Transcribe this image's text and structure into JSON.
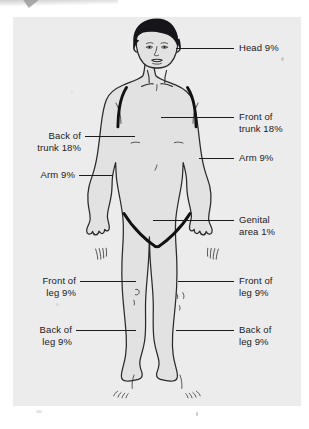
{
  "document": {
    "type": "medical-illustration",
    "subject": "Rule of Nines body surface area burn chart",
    "figure_alt": "Front view line drawing of a standing male human figure with dark hair, shaded light gray, wearing briefs outlined in heavy black"
  },
  "labels": {
    "head": "Head 9%",
    "front_of_trunk": "Front of\ntrunk 18%",
    "back_of_trunk": "Back of\ntrunk 18%",
    "arm_right": "Arm 9%",
    "arm_left": "Arm 9%",
    "genital_area": "Genital\narea 1%",
    "front_of_leg_left": "Front of\nleg 9%",
    "front_of_leg_right": "Front of\nleg 9%",
    "back_of_leg_left": "Back of\nleg 9%",
    "back_of_leg_right": "Back of\nleg 9%"
  },
  "percentages": {
    "head": 9,
    "front_of_trunk": 18,
    "back_of_trunk": 18,
    "arm_each": 9,
    "genital_area": 1,
    "front_of_leg_each": 9,
    "back_of_leg_each": 9
  },
  "colors": {
    "page_background": "#ffffff",
    "panel_background": "#ececed",
    "body_fill": "#e2e2e3",
    "outline": "#2a2a2a",
    "heavy_outline": "#111111",
    "hair": "#15151a",
    "label_text": "#1b1b1b",
    "leader_line": "#1c1c1c"
  }
}
